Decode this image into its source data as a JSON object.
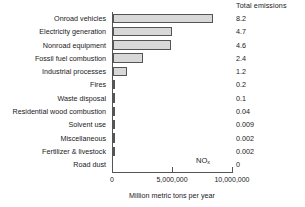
{
  "chart_data": {
    "type": "bar",
    "orientation": "horizontal",
    "title": "",
    "xlabel": "Million metric tons per year",
    "ylabel": "",
    "xlim": [
      0,
      10000000
    ],
    "xticks": [
      0,
      5000000,
      10000000
    ],
    "xtick_labels": [
      "0",
      "5,000,000",
      "10,000,000"
    ],
    "grid": false,
    "annotation": "NO",
    "annotation_subscript": "x",
    "value_column_header": "Total emissions",
    "categories": [
      "Onroad vehicles",
      "Electricity generation",
      "Nonroad equipment",
      "Fossil fuel combustion",
      "Industrial processes",
      "Fires",
      "Waste disposal",
      "Residential wood combustion",
      "Solvent use",
      "Miscellaneous",
      "Fertilizer & livestock",
      "Road dust"
    ],
    "values": [
      8300000,
      4900000,
      4800000,
      2500000,
      1200000,
      200000,
      100000,
      40000,
      9000,
      2000,
      2000,
      0
    ],
    "total_emissions_labels": [
      "8.2",
      "4.7",
      "4.6",
      "2.4",
      "1.2",
      "0.2",
      "0.1",
      "0.04",
      "0.009",
      "0.002",
      "0.002",
      "0"
    ],
    "colors": {
      "bar_fill": "#d8d8d8",
      "bar_edge": "#555555",
      "axis": "#555555",
      "text": "#1a1a1a",
      "background": "#ffffff"
    }
  }
}
